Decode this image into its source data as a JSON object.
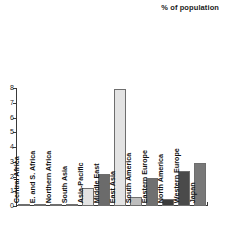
{
  "chart_data": {
    "type": "bar",
    "title": "% of population",
    "xlabel": "",
    "ylabel": "",
    "ylim": [
      0,
      8
    ],
    "yticks": [
      0,
      1,
      2,
      3,
      4,
      5,
      6,
      7,
      8
    ],
    "ytick_labels": [
      "0",
      "1",
      "2",
      "3",
      "4",
      "5",
      "6",
      "7",
      "8"
    ],
    "grid": false,
    "legend": "none",
    "categories": [
      "Central Africa",
      "E. and S. Africa",
      "Northern Africa",
      "South Asia",
      "Asia-Pacific",
      "Middle East",
      "East Asia",
      "South America",
      "Eastern Europe",
      "North America",
      "Western Europe",
      "Japan"
    ],
    "values": [
      0.03,
      0.05,
      0.04,
      0.06,
      1.2,
      2.2,
      7.9,
      0.6,
      1.9,
      0.5,
      2.4,
      2.9
    ],
    "bar_colors": [
      "#8a8a8a",
      "#8a8a8a",
      "#8a8a8a",
      "#8a8a8a",
      "#e3e3e3",
      "#6b6b6b",
      "#e3e3e3",
      "#bdbdbd",
      "#707070",
      "#3c3c3c",
      "#4a4a4a",
      "#787878"
    ]
  }
}
